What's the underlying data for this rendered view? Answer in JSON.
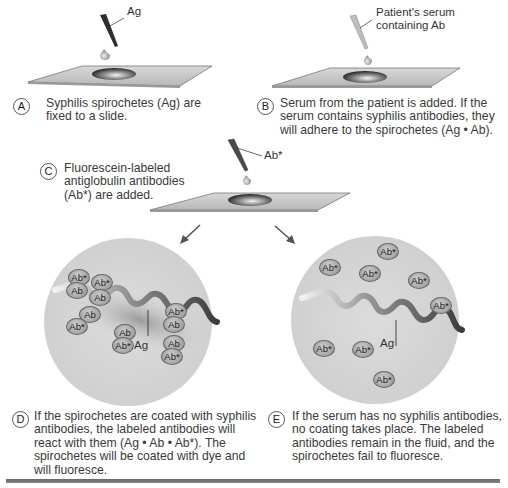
{
  "steps": {
    "A": {
      "letter": "A",
      "text_line1": "Syphilis spirochetes (Ag) are",
      "text_line2": "fixed to a slide.",
      "pipette_label": "Ag"
    },
    "B": {
      "letter": "B",
      "text_line1": "Serum from the patient is added. If the",
      "text_line2": "serum contains syphilis antibodies, they",
      "text_line3": "will adhere to the spirochetes (Ag • Ab).",
      "pipette_label_line1": "Patient's serum",
      "pipette_label_line2": "containing Ab"
    },
    "C": {
      "letter": "C",
      "text_line1": "Fluorescein-labeled",
      "text_line2": "antiglobulin antibodies",
      "text_line3": "(Ab*) are added.",
      "pipette_label": "Ab*"
    },
    "D": {
      "letter": "D",
      "text_line1": "If the spirochetes are coated with syphilis",
      "text_line2": "antibodies, the labeled antibodies will",
      "text_line3": "react with them (Ag • Ab • Ab*). The",
      "text_line4": "spirochetes will be coated with dye and",
      "text_line5": "will fluoresce.",
      "spirochete_label": "Ag",
      "antibody_labels": [
        "Ab*",
        "Ab",
        "Ab*",
        "Ab",
        "Ab",
        "Ab*",
        "Ab",
        "Ab*",
        "Ab*",
        "Ab",
        "Ab",
        "Ab*"
      ]
    },
    "E": {
      "letter": "E",
      "text_line1": "If the serum has no syphilis antibodies,",
      "text_line2": "no coating takes place. The labeled",
      "text_line3": "antibodies remain in the fluid, and the",
      "text_line4": "spirochetes fail to fluoresce.",
      "spirochete_label": "Ag",
      "antibody_labels": [
        "Ab*",
        "Ab*",
        "Ab*",
        "Ab*",
        "Ab*",
        "Ab*",
        "Ab*",
        "Ab*"
      ]
    }
  },
  "colors": {
    "slide": "#c8c8c8",
    "circle": "#d6d6d6",
    "antibody": "#a9a9a9",
    "spirochete_light": "#e8e8e8",
    "spirochete_dark": "#555555"
  }
}
